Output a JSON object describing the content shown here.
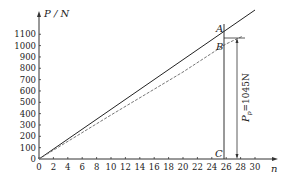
{
  "chart_data": {
    "type": "line",
    "title": "",
    "xlabel": "n",
    "ylabel": "P / N",
    "xlim": [
      0,
      31
    ],
    "ylim": [
      0,
      1150
    ],
    "x_ticks": [
      0,
      2,
      4,
      6,
      8,
      10,
      12,
      14,
      16,
      18,
      20,
      22,
      24,
      26,
      28,
      30
    ],
    "y_ticks": [
      0,
      100,
      200,
      300,
      400,
      500,
      600,
      700,
      800,
      900,
      1000,
      1100
    ],
    "grid": false,
    "series": [
      {
        "name": "linear (solid)",
        "style": "solid",
        "x": [
          0,
          30
        ],
        "y": [
          0,
          1250
        ]
      },
      {
        "name": "measured (dashed)",
        "style": "dashed",
        "x": [
          0,
          10,
          20,
          26
        ],
        "y": [
          0,
          410,
          810,
          1060
        ]
      }
    ],
    "annotations": [
      {
        "label": "A",
        "x": 25.6,
        "y": 1070
      },
      {
        "label": "B",
        "x": 25.6,
        "y": 1010
      },
      {
        "label": "C",
        "x": 25.6,
        "y": 0
      },
      {
        "label": "P_p = 1045N",
        "x": 27.3,
        "y": 1045,
        "type": "dimension-arrow"
      }
    ]
  },
  "labels": {
    "y_axis": "P / N",
    "x_axis": "n",
    "point_a": "A",
    "point_b": "B",
    "point_c": "C",
    "pp_label": "P",
    "pp_sub": "p",
    "pp_value": "=1045N"
  }
}
